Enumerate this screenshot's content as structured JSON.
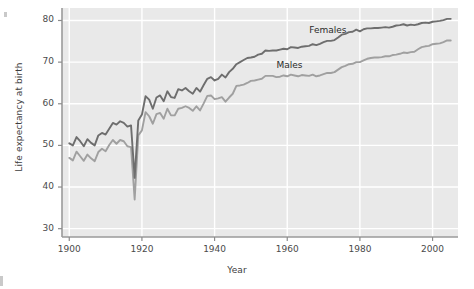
{
  "chart_data": {
    "type": "line",
    "title": "",
    "xlabel": "Year",
    "ylabel": "Life expectancy at birth",
    "xlim": [
      1898,
      2007
    ],
    "ylim": [
      28,
      83
    ],
    "xticks": [
      1900,
      1920,
      1940,
      1960,
      1980,
      2000
    ],
    "yticks": [
      30,
      40,
      50,
      60,
      70,
      80
    ],
    "grid": true,
    "legend_position": "inline-annotations",
    "panel_background": "#e9e9e9",
    "gridline_color": "#ffffff",
    "series": [
      {
        "name": "Females",
        "color": "#6e6e6e",
        "label_x": 1971,
        "label_y": 77.5,
        "x": [
          1900,
          1901,
          1902,
          1903,
          1904,
          1905,
          1906,
          1907,
          1908,
          1909,
          1910,
          1911,
          1912,
          1913,
          1914,
          1915,
          1916,
          1917,
          1918,
          1919,
          1920,
          1921,
          1922,
          1923,
          1924,
          1925,
          1926,
          1927,
          1928,
          1929,
          1930,
          1931,
          1932,
          1933,
          1934,
          1935,
          1936,
          1937,
          1938,
          1939,
          1940,
          1941,
          1942,
          1943,
          1944,
          1945,
          1946,
          1947,
          1948,
          1949,
          1950,
          1951,
          1952,
          1953,
          1954,
          1955,
          1956,
          1957,
          1958,
          1959,
          1960,
          1961,
          1962,
          1963,
          1964,
          1965,
          1966,
          1967,
          1968,
          1969,
          1970,
          1971,
          1972,
          1973,
          1974,
          1975,
          1976,
          1977,
          1978,
          1979,
          1980,
          1981,
          1982,
          1983,
          1984,
          1985,
          1986,
          1987,
          1988,
          1989,
          1990,
          1991,
          1992,
          1993,
          1994,
          1995,
          1996,
          1997,
          1998,
          1999,
          2000,
          2001,
          2002,
          2003,
          2004,
          2005
        ],
        "y": [
          50.5,
          50.0,
          52.0,
          51.0,
          49.8,
          51.5,
          50.6,
          50.0,
          52.4,
          53.0,
          52.6,
          54.0,
          55.4,
          55.0,
          55.8,
          55.4,
          54.5,
          54.8,
          42.2,
          56.0,
          57.4,
          61.8,
          61.0,
          58.8,
          61.5,
          62.0,
          60.6,
          63.0,
          61.6,
          61.4,
          63.5,
          63.2,
          63.8,
          63.0,
          62.4,
          63.8,
          62.9,
          64.5,
          66.0,
          66.4,
          65.6,
          66.0,
          67.0,
          66.3,
          67.6,
          68.4,
          69.5,
          70.0,
          70.5,
          71.0,
          71.1,
          71.3,
          71.8,
          72.0,
          72.8,
          72.7,
          72.8,
          72.8,
          73.0,
          73.2,
          73.1,
          73.6,
          73.5,
          73.4,
          73.7,
          73.8,
          73.9,
          74.3,
          74.1,
          74.4,
          74.8,
          75.1,
          75.1,
          75.3,
          75.9,
          76.6,
          76.8,
          77.2,
          77.3,
          77.8,
          77.4,
          77.9,
          78.1,
          78.1,
          78.2,
          78.2,
          78.3,
          78.4,
          78.3,
          78.5,
          78.8,
          78.9,
          79.1,
          78.8,
          79.0,
          78.9,
          79.1,
          79.4,
          79.5,
          79.4,
          79.7,
          79.8,
          79.9,
          80.1,
          80.4,
          80.4
        ]
      },
      {
        "name": "Males",
        "color": "#a0a0a0",
        "label_x": 1962,
        "label_y": 69.0,
        "x": [
          1900,
          1901,
          1902,
          1903,
          1904,
          1905,
          1906,
          1907,
          1908,
          1909,
          1910,
          1911,
          1912,
          1913,
          1914,
          1915,
          1916,
          1917,
          1918,
          1919,
          1920,
          1921,
          1922,
          1923,
          1924,
          1925,
          1926,
          1927,
          1928,
          1929,
          1930,
          1931,
          1932,
          1933,
          1934,
          1935,
          1936,
          1937,
          1938,
          1939,
          1940,
          1941,
          1942,
          1943,
          1944,
          1945,
          1946,
          1947,
          1948,
          1949,
          1950,
          1951,
          1952,
          1953,
          1954,
          1955,
          1956,
          1957,
          1958,
          1959,
          1960,
          1961,
          1962,
          1963,
          1964,
          1965,
          1966,
          1967,
          1968,
          1969,
          1970,
          1971,
          1972,
          1973,
          1974,
          1975,
          1976,
          1977,
          1978,
          1979,
          1980,
          1981,
          1982,
          1983,
          1984,
          1985,
          1986,
          1987,
          1988,
          1989,
          1990,
          1991,
          1992,
          1993,
          1994,
          1995,
          1996,
          1997,
          1998,
          1999,
          2000,
          2001,
          2002,
          2003,
          2004,
          2005
        ],
        "y": [
          47.0,
          46.4,
          48.5,
          47.4,
          46.3,
          47.8,
          46.9,
          46.2,
          48.4,
          49.2,
          48.6,
          50.1,
          51.3,
          50.4,
          51.3,
          51.0,
          49.8,
          49.6,
          37.0,
          52.4,
          53.6,
          58.0,
          57.0,
          55.2,
          57.5,
          57.8,
          56.4,
          58.8,
          57.2,
          57.2,
          58.8,
          59.0,
          59.4,
          59.0,
          58.3,
          59.4,
          58.4,
          60.1,
          61.9,
          62.0,
          61.1,
          61.3,
          61.6,
          60.5,
          61.5,
          62.4,
          64.3,
          64.4,
          64.6,
          65.0,
          65.5,
          65.6,
          65.8,
          66.0,
          66.7,
          66.7,
          66.7,
          66.4,
          66.5,
          66.8,
          66.6,
          67.0,
          66.8,
          66.6,
          66.9,
          66.8,
          66.7,
          67.0,
          66.6,
          66.8,
          67.1,
          67.4,
          67.4,
          67.6,
          68.2,
          68.8,
          69.1,
          69.5,
          69.6,
          70.0,
          70.0,
          70.4,
          70.8,
          71.0,
          71.1,
          71.1,
          71.2,
          71.4,
          71.4,
          71.7,
          71.8,
          72.0,
          72.3,
          72.2,
          72.4,
          72.5,
          73.1,
          73.6,
          73.8,
          73.9,
          74.3,
          74.4,
          74.5,
          74.8,
          75.2,
          75.2
        ]
      }
    ]
  }
}
